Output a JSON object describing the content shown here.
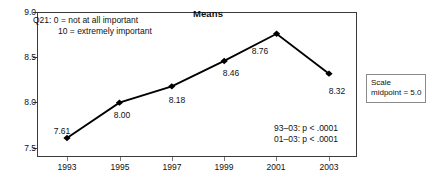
{
  "chart_data": {
    "type": "line",
    "title": "Means",
    "xlabel": "",
    "ylabel": "",
    "categories": [
      "1993",
      "1995",
      "1997",
      "1999",
      "2001",
      "2003"
    ],
    "values": [
      7.61,
      8.0,
      8.18,
      8.46,
      8.76,
      8.32
    ],
    "point_labels": [
      "7.61",
      "8.00",
      "8.18",
      "8.46",
      "8.76",
      "8.32"
    ],
    "ylim": [
      7.5,
      9.0
    ],
    "y_ticks": [
      "7.5",
      "8.0",
      "8.5",
      "9.0"
    ],
    "y_tick_values": [
      7.5,
      8.0,
      8.5,
      9.0
    ],
    "grid": false,
    "legend": "none",
    "series": [
      {
        "name": "Means",
        "values": [
          7.61,
          8.0,
          8.18,
          8.46,
          8.76,
          8.32
        ],
        "marker": "diamond",
        "color": "#000000"
      }
    ],
    "annotations": [
      "Q21: 0 = not at all important",
      "10 = extremely important",
      "93–03: p < .0001",
      "01–03: p < .0001",
      "Scale midpoint = 5.0"
    ]
  },
  "notes": {
    "q21_line1": "Q21: 0 = not at all important",
    "q21_line2": "10 = extremely important",
    "pval_line1": "93–03: p < .0001",
    "pval_line2": "01–03: p < .0001",
    "scale_line1": "Scale",
    "scale_line2": "midpoint = 5.0"
  },
  "colors": {
    "line": "#000000",
    "marker": "#000000",
    "axis": "#3a3a3a",
    "text": "#111111",
    "box_border": "#8a8a8a"
  }
}
